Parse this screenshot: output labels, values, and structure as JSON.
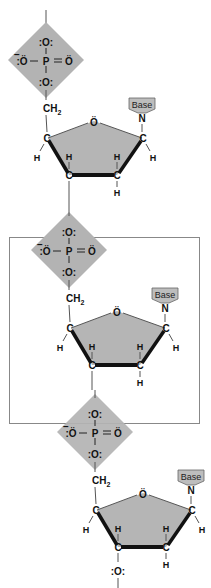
{
  "diagram": {
    "title": "",
    "type": "nucleic-acid-backbone",
    "colors": {
      "phosphate_fill": "#b3b3b3",
      "sugar_fill": "#b5b5b5",
      "base_fill": "#bdbdbd",
      "bond": "#111111",
      "thin_bond": "#555555",
      "highlight_box": "#888888"
    },
    "phosphate": {
      "P": "P",
      "O_top": ":O:",
      "O_left": ":Ö",
      "O_right": "Ö",
      "O_bottom": ":O:",
      "charge": "−"
    },
    "sugar": {
      "ring_O": "Ö",
      "C": "C",
      "H": "H",
      "CH2": "CH",
      "CH2_sub": "2",
      "N": "N",
      "base_label": "Base"
    },
    "terminal_O": ":O:",
    "units": [
      {
        "label": "nucleotide-1",
        "highlighted": false
      },
      {
        "label": "nucleotide-2",
        "highlighted": true
      },
      {
        "label": "nucleotide-3",
        "highlighted": false
      }
    ]
  }
}
